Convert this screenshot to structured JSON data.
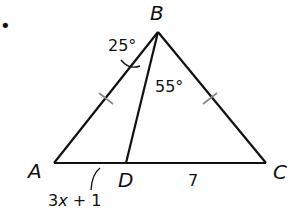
{
  "diagram": {
    "type": "triangle",
    "bullet": "•",
    "vertices": {
      "A": {
        "label": "A"
      },
      "B": {
        "label": "B"
      },
      "C": {
        "label": "C"
      },
      "D": {
        "label": "D"
      }
    },
    "angles": {
      "ABD": "25°",
      "DBC": "55°"
    },
    "segments": {
      "AD": {
        "pre": "3",
        "var": "x",
        "post": " + 1"
      },
      "DC": "7"
    },
    "congruent_sides": [
      "AB",
      "BC"
    ],
    "colors": {
      "stroke": "#111111",
      "tick": "#888888",
      "background": "#ffffff"
    }
  }
}
